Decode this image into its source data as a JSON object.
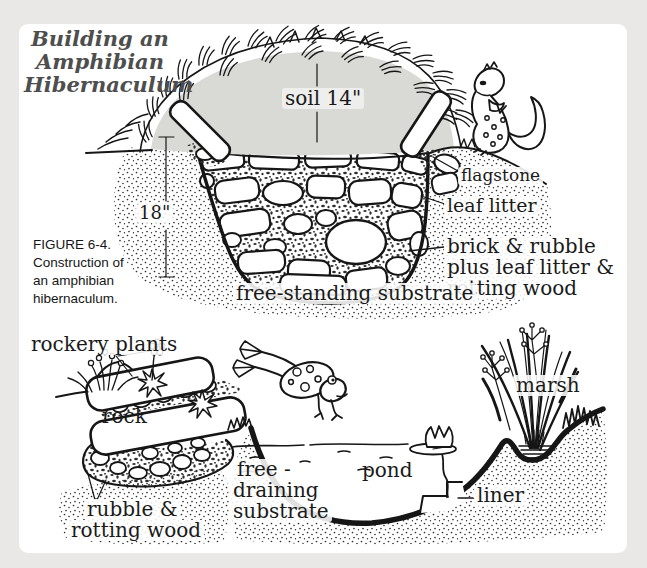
{
  "colors": {
    "page_bg": "#e9e8e6",
    "panel_bg": "#ffffff",
    "ink": "#161616",
    "soil_fill": "#d9d9d6",
    "title_color": "#4e4e4e"
  },
  "title": {
    "lines": [
      "Building an",
      "Amphibian",
      "Hibernaculum"
    ]
  },
  "caption": {
    "lines": [
      "FIGURE 6-4.",
      "Construction of",
      "an amphibian",
      "hibernaculum."
    ]
  },
  "icons": {
    "newt": "newt-cartoon-icon",
    "frog": "frog-cartoon-icon",
    "water_lily": "water-lily-icon",
    "marsh_reeds": "marsh-reeds",
    "rockery_flowers": "rockery-flowers"
  },
  "top_diagram": {
    "labels": {
      "soil": "soil  14\"",
      "depth": "18\"",
      "flagstone": "flagstone",
      "leaf_litter": "leaf litter",
      "brick_rubble": [
        "brick & rubble",
        "plus leaf litter &",
        "rotting wood"
      ],
      "substrate": "free-standing substrate"
    }
  },
  "bottom_diagram": {
    "labels": {
      "rockery_plants": "rockery plants",
      "rock": "rock",
      "rubble": [
        "rubble &",
        "rotting wood"
      ],
      "free_draining": [
        "free -",
        "draining",
        "substrate"
      ],
      "pond": "pond",
      "marsh": "marsh",
      "liner": "liner"
    }
  }
}
